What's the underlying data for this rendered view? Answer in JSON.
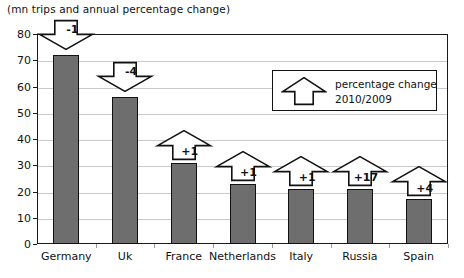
{
  "chart_data": {
    "type": "bar",
    "title": "(mn trips and annual percentage change)",
    "xlabel": "",
    "ylabel": "",
    "ylim": [
      0,
      80
    ],
    "ytick_step": 10,
    "yticks": [
      "0",
      "10",
      "20",
      "30",
      "40",
      "50",
      "60",
      "70",
      "80"
    ],
    "grid": true,
    "legend_position": "inside-top-right",
    "categories": [
      "Germany",
      "Uk",
      "France",
      "Netherlands",
      "Italy",
      "Russia",
      "Spain"
    ],
    "values": [
      72,
      56,
      31,
      23,
      21,
      21,
      17
    ],
    "series": [
      {
        "name": "mn trips",
        "values": [
          72,
          56,
          31,
          23,
          21,
          21,
          17
        ]
      }
    ],
    "annotations": [
      {
        "category": "Germany",
        "label": "-1",
        "direction": "down"
      },
      {
        "category": "Uk",
        "label": "-4",
        "direction": "down"
      },
      {
        "category": "France",
        "label": "+1",
        "direction": "up"
      },
      {
        "category": "Netherlands",
        "label": "+1",
        "direction": "up"
      },
      {
        "category": "Italy",
        "label": "+1",
        "direction": "up"
      },
      {
        "category": "Russia",
        "label": "+17",
        "direction": "up"
      },
      {
        "category": "Spain",
        "label": "+4",
        "direction": "up"
      }
    ],
    "legend": {
      "icon": "up-arrow-icon",
      "line1": "percentage change",
      "line2": "2010/2009"
    },
    "colors": {
      "bar_fill": "#6e6e6e",
      "bar_border": "#111111",
      "gridline": "#c9c9c9",
      "axis": "#1a1a1a",
      "text": "#111111",
      "arrow_fill": "#ffffff",
      "arrow_stroke": "#111111"
    }
  }
}
